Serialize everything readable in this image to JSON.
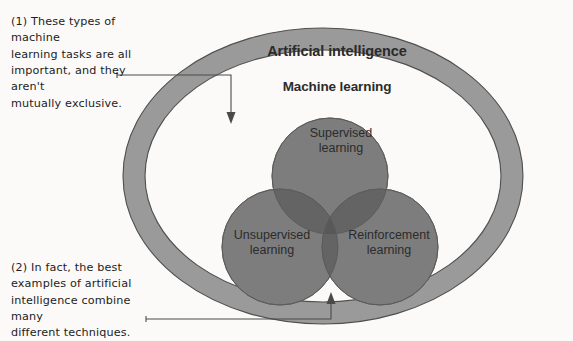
{
  "figure": {
    "background_color": "#fbfaf8",
    "ring_color": "#9a9a9a",
    "circle_color": "#7d7d7d",
    "overlap_color": "#5e5e5e",
    "inner_fill_color": "#fbfaf8",
    "annotation_color": "#1d1d1d"
  },
  "diagram": {
    "outer_ring_label": "Artificial intelligence",
    "inner_region_label": "Machine learning",
    "circles": [
      {
        "id": "supervised",
        "label": "Supervised\nlearning"
      },
      {
        "id": "unsupervised",
        "label": "Unsupervised\nlearning"
      },
      {
        "id": "reinforcement",
        "label": "Reinforcement\nlearning"
      }
    ]
  },
  "annotations": [
    {
      "id": "note-1",
      "marker": "(1)",
      "text": "(1) These types of machine\nlearning tasks are all\nimportant, and they aren't\nmutually exclusive.",
      "points_to": "Machine learning region"
    },
    {
      "id": "note-2",
      "marker": "(2)",
      "text": "(2) In fact, the best\nexamples of artificial\nintelligence combine many\ndifferent techniques.",
      "points_to": "Venn overlap region"
    }
  ]
}
